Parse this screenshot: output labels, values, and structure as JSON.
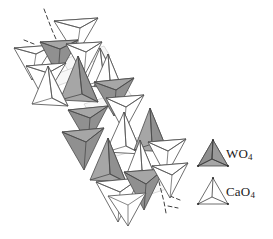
{
  "figure": {
    "name": "scheelite-tetrahedra-chain-diagram",
    "background_color": "#ffffff",
    "width": 273,
    "height": 239
  },
  "legend": {
    "items": [
      {
        "id": "wo4",
        "label_text": "WO",
        "label_subscript": "4",
        "fill_color": "#9b9b9b",
        "fill_color_shaded": "#8a8a8a",
        "stroke_color": "#3a3a3a",
        "polyhedron": "tetrahedron"
      },
      {
        "id": "cao4",
        "label_text": "CaO",
        "label_subscript": "4",
        "fill_color": "#ffffff",
        "fill_color_shaded": "#ffffff",
        "stroke_color": "#3a3a3a",
        "polyhedron": "tetrahedron"
      }
    ]
  },
  "structure": {
    "stroke_color": "#4a4a4a",
    "wo4_fill": "#a2a2a2",
    "wo4_fill_dark": "#8e8e8e",
    "cao4_fill": "#ffffff",
    "axis_line_style": "dashed",
    "chain_direction": "upper-left to lower-right",
    "tetrahedra": [
      {
        "id": "t01",
        "type": "CaO4",
        "cx": 72,
        "cy": 32,
        "size": 27,
        "orientation": "apex-down"
      },
      {
        "id": "t02",
        "type": "CaO4",
        "cx": 30,
        "cy": 58,
        "size": 24,
        "orientation": "apex-down"
      },
      {
        "id": "t03",
        "type": "WO4",
        "cx": 57,
        "cy": 52,
        "size": 24,
        "orientation": "apex-down"
      },
      {
        "id": "t04",
        "type": "CaO4",
        "cx": 44,
        "cy": 78,
        "size": 24,
        "orientation": "apex-down"
      },
      {
        "id": "t05",
        "type": "CaO4",
        "cx": 84,
        "cy": 56,
        "size": 22,
        "orientation": "apex-down"
      },
      {
        "id": "t06",
        "type": "WO4",
        "cx": 79,
        "cy": 76,
        "size": 25,
        "orientation": "apex-up"
      },
      {
        "id": "t07",
        "type": "CaO4",
        "cx": 100,
        "cy": 66,
        "size": 22,
        "orientation": "apex-up"
      },
      {
        "id": "t08",
        "type": "CaO4",
        "cx": 62,
        "cy": 90,
        "size": 26,
        "orientation": "apex-up"
      },
      {
        "id": "t09",
        "type": "WO4",
        "cx": 114,
        "cy": 92,
        "size": 24,
        "orientation": "apex-down"
      },
      {
        "id": "t10",
        "type": "WO4",
        "cx": 88,
        "cy": 120,
        "size": 24,
        "orientation": "apex-down"
      },
      {
        "id": "t11",
        "type": "CaO4",
        "cx": 124,
        "cy": 110,
        "size": 22,
        "orientation": "apex-down"
      },
      {
        "id": "t12",
        "type": "WO4",
        "cx": 84,
        "cy": 144,
        "size": 26,
        "orientation": "apex-down"
      },
      {
        "id": "t13",
        "type": "CaO4",
        "cx": 123,
        "cy": 136,
        "size": 24,
        "orientation": "apex-up"
      },
      {
        "id": "t14",
        "type": "WO4",
        "cx": 150,
        "cy": 130,
        "size": 24,
        "orientation": "apex-up"
      },
      {
        "id": "t15",
        "type": "WO4",
        "cx": 108,
        "cy": 160,
        "size": 25,
        "orientation": "apex-up"
      },
      {
        "id": "t16",
        "type": "CaO4",
        "cx": 140,
        "cy": 160,
        "size": 22,
        "orientation": "apex-up"
      },
      {
        "id": "t17",
        "type": "CaO4",
        "cx": 166,
        "cy": 156,
        "size": 24,
        "orientation": "apex-down"
      },
      {
        "id": "t18",
        "type": "WO4",
        "cx": 144,
        "cy": 190,
        "size": 25,
        "orientation": "apex-down"
      },
      {
        "id": "t19",
        "type": "CaO4",
        "cx": 118,
        "cy": 196,
        "size": 26,
        "orientation": "apex-down"
      },
      {
        "id": "t20",
        "type": "CaO4",
        "cx": 168,
        "cy": 182,
        "size": 22,
        "orientation": "apex-down"
      }
    ],
    "axis_lines": [
      {
        "id": "axis-top-left",
        "x1": 44,
        "y1": 9,
        "x2": 66,
        "y2": 60
      },
      {
        "id": "axis-bottom-right",
        "x1": 156,
        "y1": 168,
        "x2": 166,
        "y2": 213
      }
    ]
  }
}
